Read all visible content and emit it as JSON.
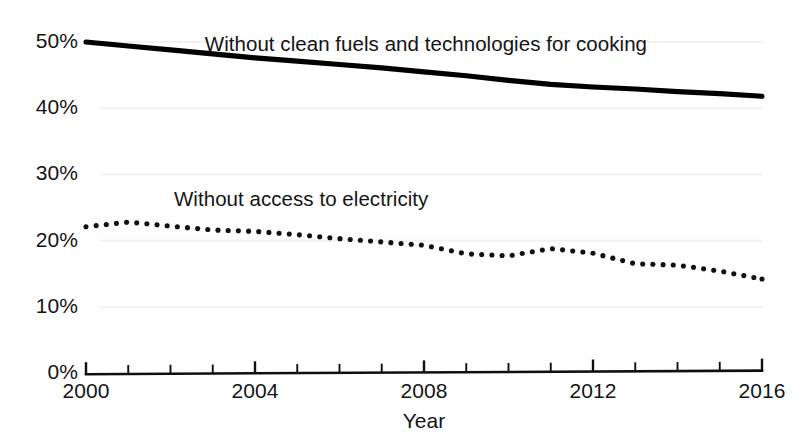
{
  "chart_data": {
    "type": "line",
    "title": "",
    "xlabel": "Year",
    "ylabel": "",
    "xlim": [
      2000,
      2016
    ],
    "ylim": [
      0,
      50
    ],
    "grid": false,
    "legend_position": "inline-annotations",
    "y_tick_labels": [
      "50%",
      "40%",
      "30%",
      "20%",
      "10%",
      "0%"
    ],
    "y_tick_values": [
      50,
      40,
      30,
      20,
      10,
      0
    ],
    "x_tick_labels": [
      "2000",
      "2004",
      "2008",
      "2012",
      "2016"
    ],
    "x_tick_values": [
      2000,
      2004,
      2008,
      2012,
      2016
    ],
    "x_minor_ticks": [
      2000,
      2001,
      2002,
      2003,
      2004,
      2005,
      2006,
      2007,
      2008,
      2009,
      2010,
      2011,
      2012,
      2013,
      2014,
      2015,
      2016
    ],
    "x": [
      2000,
      2001,
      2002,
      2003,
      2004,
      2005,
      2006,
      2007,
      2008,
      2009,
      2010,
      2011,
      2012,
      2013,
      2014,
      2015,
      2016
    ],
    "series": [
      {
        "name": "Without clean fuels and technologies for cooking",
        "style": "solid",
        "color": "#000000",
        "label_x": 2007.9,
        "label_y": 49.6,
        "values": [
          50.0,
          49.4,
          48.8,
          48.2,
          47.6,
          47.1,
          46.6,
          46.1,
          45.5,
          44.9,
          44.2,
          43.6,
          43.2,
          42.9,
          42.5,
          42.2,
          41.8
        ]
      },
      {
        "name": "Without access to electricity",
        "style": "dotted",
        "color": "#111111",
        "label_x": 2005.1,
        "label_y": 26.2,
        "values": [
          22.1,
          22.8,
          22.2,
          21.6,
          21.4,
          20.9,
          20.3,
          19.8,
          19.3,
          18.0,
          17.7,
          18.8,
          18.1,
          16.5,
          16.3,
          15.4,
          14.2
        ]
      }
    ]
  },
  "geometry": {
    "plot_left_px": 86,
    "plot_right_px": 762,
    "y_zero_px": 373,
    "y_fifty_px": 42
  }
}
